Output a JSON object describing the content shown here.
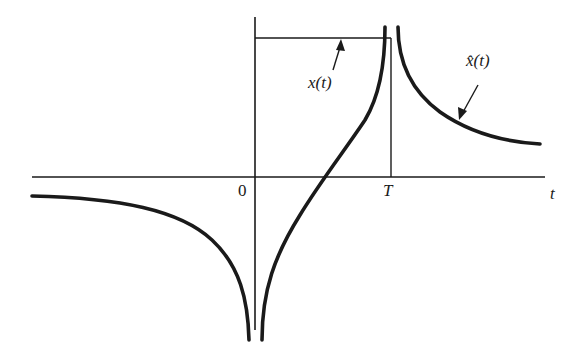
{
  "figure": {
    "axis": {
      "horizontal_label": "t",
      "origin_label": "0",
      "tick_label_T": "T"
    },
    "curves": [
      {
        "name": "x(t)",
        "label": "x(t)",
        "style": "thin rectangular pulse from 0 to T"
      },
      {
        "name": "x-hat(t)",
        "label": "x̂(t)",
        "style": "thick curve with singularities at 0 and T"
      }
    ],
    "colors": {
      "background": "#ffffff",
      "ink": "#1a1a1a"
    }
  }
}
